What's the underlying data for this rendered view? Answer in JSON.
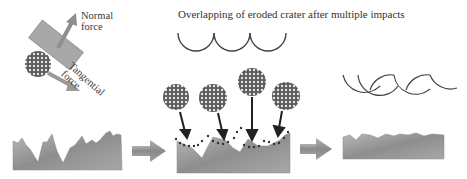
{
  "title": "Overlapping of eroded crater after multiple impacts",
  "labels": {
    "normal_force_line1": "Normal",
    "normal_force_line2": "force",
    "tangential_force_line1": "Tangential",
    "tangential_force_line2": "force"
  },
  "stages": [
    {
      "name": "initial-rough-surface",
      "description": "Jagged peaked surface"
    },
    {
      "name": "particle-impacts",
      "description": "Four particles impacting surface, eroded crater debris dots"
    },
    {
      "name": "eroded-surface",
      "description": "Flattened eroded surface"
    }
  ],
  "crater_profiles": {
    "single_row_arcs": 3,
    "overlapping_arcs": 5
  },
  "colors": {
    "surface": "#9a9a9a",
    "arrow": "#8c8c8c",
    "line": "#444444",
    "particle": "#6e6e6e"
  }
}
